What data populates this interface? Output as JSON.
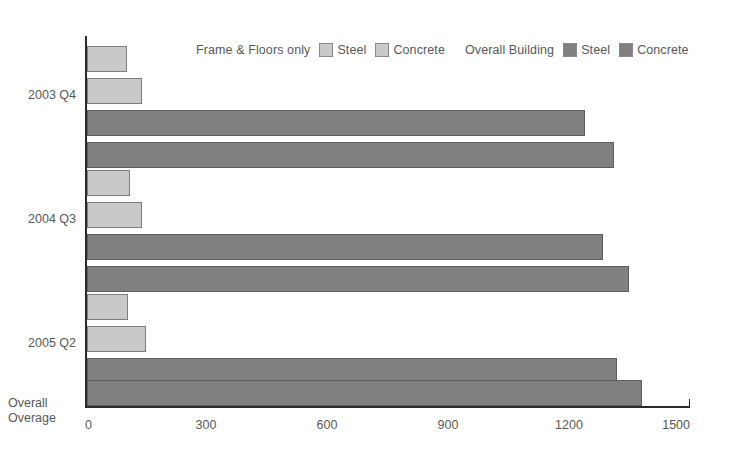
{
  "chart_data": {
    "type": "bar",
    "orientation": "horizontal",
    "title": "",
    "xlabel": "",
    "ylabel": "Overall Overage",
    "ylabel_lines": [
      "Overall",
      "Overage"
    ],
    "xlim": [
      0,
      1500
    ],
    "xticks": [
      0,
      300,
      600,
      900,
      1200,
      1500
    ],
    "xtick_labels": [
      "0",
      "300",
      "600",
      "900",
      "1200",
      "1500"
    ],
    "grid": false,
    "categories": [
      "2003 Q4",
      "2004 Q3",
      "2005 Q2"
    ],
    "series": [
      {
        "name": "Frame & Floors only Steel",
        "group": "Frame & Floors only",
        "material": "Steel",
        "shade": "light",
        "color": "#c9c9c9",
        "values": [
          98,
          107,
          102
        ]
      },
      {
        "name": "Frame & Floors only Concrete",
        "group": "Frame & Floors only",
        "material": "Concrete",
        "shade": "light",
        "color": "#c9c9c9",
        "values": [
          136,
          136,
          146
        ]
      },
      {
        "name": "Overall Building Steel",
        "group": "Overall Building",
        "material": "Steel",
        "shade": "dark",
        "color": "#808080",
        "values": [
          1235,
          1280,
          1315
        ]
      },
      {
        "name": "Overall Building Concrete",
        "group": "Overall Building",
        "material": "Concrete",
        "shade": "dark",
        "color": "#808080",
        "values": [
          1307,
          1344,
          1376
        ]
      }
    ],
    "legend": {
      "position": "top",
      "groups": [
        {
          "title": "Frame & Floors only",
          "entries": [
            {
              "label": "Steel",
              "color": "#c9c9c9",
              "swatch": "light-swatch-icon"
            },
            {
              "label": "Concrete",
              "color": "#c9c9c9",
              "swatch": "light-swatch-icon"
            }
          ]
        },
        {
          "title": "Overall Building",
          "entries": [
            {
              "label": "Steel",
              "color": "#808080",
              "swatch": "dark-swatch-icon"
            },
            {
              "label": "Concrete",
              "color": "#808080",
              "swatch": "dark-swatch-icon"
            }
          ]
        }
      ]
    },
    "colors": {
      "light": "#c9c9c9",
      "dark": "#808080",
      "axis": "#2b2b2b",
      "text": "#595959",
      "background": "#ffffff"
    }
  }
}
